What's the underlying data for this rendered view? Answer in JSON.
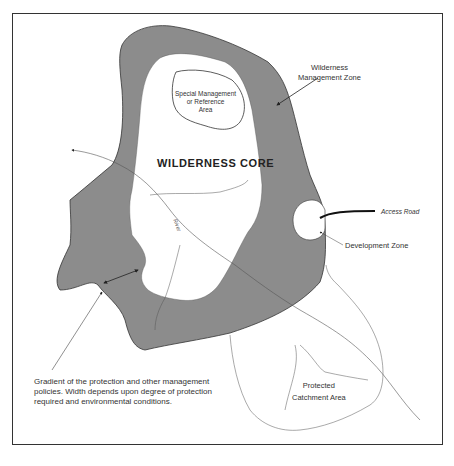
{
  "diagram": {
    "type": "zoning-map",
    "core_title": "WILDERNESS CORE",
    "labels": {
      "wilderness_management_zone": [
        "Wilderness",
        "Management Zone"
      ],
      "special_management": [
        "Special Management",
        "or Reference",
        "Area"
      ],
      "access_road": "Access Road",
      "development_zone": "Development Zone",
      "river": "River",
      "protected_catchment": [
        "Protected",
        "Catchment Area"
      ],
      "gradient_note": "Gradient of the protection and other management policies. Width depends upon degree of protection required and environmental conditions."
    },
    "colors": {
      "zone_fill": "#8c8c8c",
      "stroke": "#333333",
      "background": "#ffffff"
    }
  }
}
